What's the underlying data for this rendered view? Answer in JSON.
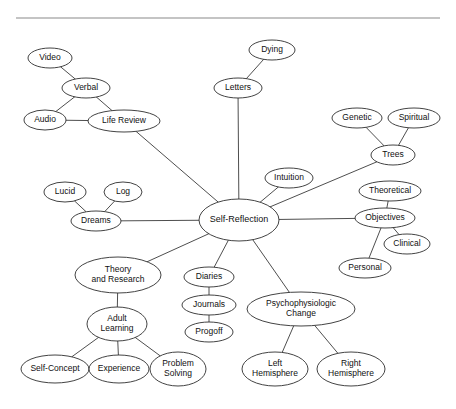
{
  "diagram": {
    "type": "concept-map",
    "divider": {
      "name": "top-rule",
      "x1": 16,
      "y1": 18,
      "x2": 440,
      "y2": 18,
      "color": "#8a8a8a"
    },
    "style": {
      "node_fill": "#ffffff",
      "node_stroke": "#2e2e2e",
      "edge_stroke": "#3a3a3a",
      "text_color": "#111111",
      "background": "#ffffff"
    },
    "nodes": [
      {
        "id": "video",
        "label": "Video",
        "cx": 50,
        "cy": 58,
        "rx": 22,
        "ry": 10,
        "font": 8.5,
        "lines": [
          "Video"
        ]
      },
      {
        "id": "verbal",
        "label": "Verbal",
        "cx": 86,
        "cy": 88,
        "rx": 24,
        "ry": 10,
        "font": 8.5,
        "lines": [
          "Verbal"
        ]
      },
      {
        "id": "audio",
        "label": "Audio",
        "cx": 45,
        "cy": 120,
        "rx": 21,
        "ry": 10,
        "font": 8.5,
        "lines": [
          "Audio"
        ]
      },
      {
        "id": "life-review",
        "label": "Life Review",
        "cx": 124,
        "cy": 121,
        "rx": 36,
        "ry": 11,
        "font": 8.5,
        "lines": [
          "Life Review"
        ]
      },
      {
        "id": "dying",
        "label": "Dying",
        "cx": 272,
        "cy": 50,
        "rx": 23,
        "ry": 10,
        "font": 8.5,
        "lines": [
          "Dying"
        ]
      },
      {
        "id": "letters",
        "label": "Letters",
        "cx": 238,
        "cy": 88,
        "rx": 24,
        "ry": 10,
        "font": 8.5,
        "lines": [
          "Letters"
        ]
      },
      {
        "id": "genetic",
        "label": "Genetic",
        "cx": 357,
        "cy": 118,
        "rx": 25,
        "ry": 10,
        "font": 8.5,
        "lines": [
          "Genetic"
        ]
      },
      {
        "id": "spiritual",
        "label": "Spiritual",
        "cx": 414,
        "cy": 118,
        "rx": 26,
        "ry": 10,
        "font": 8.5,
        "lines": [
          "Spiritual"
        ]
      },
      {
        "id": "trees",
        "label": "Trees",
        "cx": 393,
        "cy": 155,
        "rx": 22,
        "ry": 10,
        "font": 8.5,
        "lines": [
          "Trees"
        ]
      },
      {
        "id": "intuition",
        "label": "Intuition",
        "cx": 289,
        "cy": 178,
        "rx": 24,
        "ry": 10,
        "font": 8.5,
        "lines": [
          "Intuition"
        ]
      },
      {
        "id": "theoretical",
        "label": "Theoretical",
        "cx": 390,
        "cy": 191,
        "rx": 31,
        "ry": 10,
        "font": 8.5,
        "lines": [
          "Theoretical"
        ]
      },
      {
        "id": "objectives",
        "label": "Objectives",
        "cx": 385,
        "cy": 218,
        "rx": 30,
        "ry": 10,
        "font": 8.5,
        "lines": [
          "Objectives"
        ]
      },
      {
        "id": "clinical",
        "label": "Clinical",
        "cx": 407,
        "cy": 244,
        "rx": 23,
        "ry": 10,
        "font": 8.5,
        "lines": [
          "Clinical"
        ]
      },
      {
        "id": "personal",
        "label": "Personal",
        "cx": 365,
        "cy": 268,
        "rx": 26,
        "ry": 10,
        "font": 8.5,
        "lines": [
          "Personal"
        ]
      },
      {
        "id": "lucid",
        "label": "Lucid",
        "cx": 65,
        "cy": 192,
        "rx": 21,
        "ry": 10,
        "font": 8.5,
        "lines": [
          "Lucid"
        ]
      },
      {
        "id": "log",
        "label": "Log",
        "cx": 123,
        "cy": 192,
        "rx": 19,
        "ry": 10,
        "font": 8.5,
        "lines": [
          "Log"
        ]
      },
      {
        "id": "dreams",
        "label": "Dreams",
        "cx": 96,
        "cy": 221,
        "rx": 25,
        "ry": 10,
        "font": 8.5,
        "lines": [
          "Dreams"
        ]
      },
      {
        "id": "self-reflection",
        "label": "Self-Reflection",
        "cx": 239,
        "cy": 220,
        "rx": 40,
        "ry": 21,
        "font": 9,
        "lines": [
          "Self-Reflection"
        ]
      },
      {
        "id": "theory-research",
        "label": "Theory and Research",
        "cx": 118,
        "cy": 275,
        "rx": 43,
        "ry": 18,
        "font": 8.5,
        "lines": [
          "Theory",
          "and Research"
        ]
      },
      {
        "id": "adult-learning",
        "label": "Adult Learning",
        "cx": 117,
        "cy": 324,
        "rx": 30,
        "ry": 17,
        "font": 8.5,
        "lines": [
          "Adult",
          "Learning"
        ]
      },
      {
        "id": "self-concept",
        "label": "Self-Concept",
        "cx": 55,
        "cy": 369,
        "rx": 34,
        "ry": 14,
        "font": 8.5,
        "lines": [
          "Self-Concept"
        ]
      },
      {
        "id": "experience",
        "label": "Experience",
        "cx": 119,
        "cy": 369,
        "rx": 30,
        "ry": 14,
        "font": 8.5,
        "lines": [
          "Experience"
        ]
      },
      {
        "id": "problem-solving",
        "label": "Problem Solving",
        "cx": 178,
        "cy": 369,
        "rx": 28,
        "ry": 17,
        "font": 8.5,
        "lines": [
          "Problem",
          "Solving"
        ]
      },
      {
        "id": "diaries",
        "label": "Diaries",
        "cx": 209,
        "cy": 277,
        "rx": 25,
        "ry": 10,
        "font": 8.5,
        "lines": [
          "Diaries"
        ]
      },
      {
        "id": "journals",
        "label": "Journals",
        "cx": 209,
        "cy": 305,
        "rx": 27,
        "ry": 10,
        "font": 8.5,
        "lines": [
          "Journals"
        ]
      },
      {
        "id": "progoff",
        "label": "Progoff",
        "cx": 209,
        "cy": 332,
        "rx": 24,
        "ry": 10,
        "font": 8.5,
        "lines": [
          "Progoff"
        ]
      },
      {
        "id": "psychophysiologic-change",
        "label": "Psychophysiologic Change",
        "cx": 301,
        "cy": 309,
        "rx": 54,
        "ry": 17,
        "font": 8.5,
        "lines": [
          "Psychophysiologic",
          "Change"
        ]
      },
      {
        "id": "left-hemisphere",
        "label": "Left Hemisphere",
        "cx": 275,
        "cy": 369,
        "rx": 33,
        "ry": 17,
        "font": 8.5,
        "lines": [
          "Left",
          "Hemisphere"
        ]
      },
      {
        "id": "right-hemisphere",
        "label": "Right Hemisphere",
        "cx": 351,
        "cy": 369,
        "rx": 34,
        "ry": 17,
        "font": 8.5,
        "lines": [
          "Right",
          "Hemisphere"
        ]
      }
    ],
    "edges": [
      {
        "from": "video",
        "to": "verbal"
      },
      {
        "from": "verbal",
        "to": "audio"
      },
      {
        "from": "verbal",
        "to": "life-review"
      },
      {
        "from": "audio",
        "to": "life-review"
      },
      {
        "from": "life-review",
        "to": "self-reflection"
      },
      {
        "from": "dying",
        "to": "letters"
      },
      {
        "from": "letters",
        "to": "self-reflection"
      },
      {
        "from": "genetic",
        "to": "trees"
      },
      {
        "from": "spiritual",
        "to": "trees"
      },
      {
        "from": "trees",
        "to": "self-reflection"
      },
      {
        "from": "intuition",
        "to": "self-reflection"
      },
      {
        "from": "theoretical",
        "to": "objectives"
      },
      {
        "from": "objectives",
        "to": "clinical"
      },
      {
        "from": "objectives",
        "to": "personal"
      },
      {
        "from": "objectives",
        "to": "self-reflection"
      },
      {
        "from": "lucid",
        "to": "dreams"
      },
      {
        "from": "log",
        "to": "dreams"
      },
      {
        "from": "dreams",
        "to": "self-reflection"
      },
      {
        "from": "self-reflection",
        "to": "theory-research"
      },
      {
        "from": "theory-research",
        "to": "adult-learning"
      },
      {
        "from": "adult-learning",
        "to": "self-concept"
      },
      {
        "from": "adult-learning",
        "to": "experience"
      },
      {
        "from": "adult-learning",
        "to": "problem-solving"
      },
      {
        "from": "self-reflection",
        "to": "diaries"
      },
      {
        "from": "diaries",
        "to": "journals"
      },
      {
        "from": "journals",
        "to": "progoff"
      },
      {
        "from": "self-reflection",
        "to": "psychophysiologic-change"
      },
      {
        "from": "psychophysiologic-change",
        "to": "left-hemisphere"
      },
      {
        "from": "psychophysiologic-change",
        "to": "right-hemisphere"
      }
    ]
  }
}
